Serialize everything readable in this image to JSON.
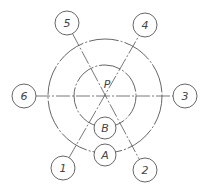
{
  "diagram": {
    "type": "technical-drawing",
    "center": {
      "x": 105,
      "y": 96,
      "label": "P"
    },
    "outer_circle": {
      "r": 57
    },
    "inner_circle": {
      "r": 31
    },
    "colors": {
      "stroke": "#555555",
      "centerline": "#777777",
      "text": "#444444"
    },
    "balloons": [
      {
        "id": "1",
        "label": "1",
        "cx": 63,
        "cy": 168,
        "r": 12
      },
      {
        "id": "2",
        "label": "2",
        "cx": 145,
        "cy": 170,
        "r": 12
      },
      {
        "id": "3",
        "label": "3",
        "cx": 185,
        "cy": 96,
        "r": 12
      },
      {
        "id": "4",
        "label": "4",
        "cx": 145,
        "cy": 25,
        "r": 12
      },
      {
        "id": "5",
        "label": "5",
        "cx": 67,
        "cy": 23,
        "r": 12
      },
      {
        "id": "6",
        "label": "6",
        "cx": 24,
        "cy": 96,
        "r": 12
      }
    ],
    "inner_balloons": [
      {
        "id": "B",
        "label": "B",
        "cx": 105,
        "cy": 128,
        "r": 11
      },
      {
        "id": "A",
        "label": "A",
        "cx": 105,
        "cy": 155,
        "r": 11
      }
    ]
  }
}
